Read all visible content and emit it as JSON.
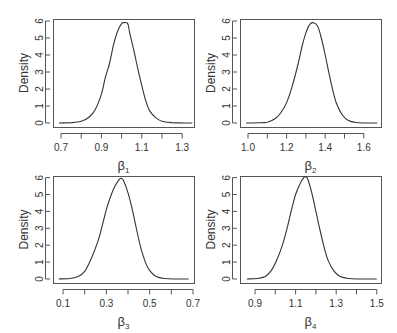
{
  "chart_data": [
    {
      "type": "line",
      "title": "",
      "xlabel": "β1",
      "xlabel_base": "β",
      "xlabel_sub": "1",
      "ylabel": "Density",
      "xticks": [
        0.7,
        0.8,
        0.9,
        1.0,
        1.1,
        1.2,
        1.3
      ],
      "xtick_labels": [
        "0.7",
        "",
        "0.9",
        "",
        "1.1",
        "",
        "1.3"
      ],
      "yticks": [
        0,
        1,
        2,
        3,
        4,
        5,
        6
      ],
      "xlim": [
        0.69,
        1.35
      ],
      "ylim": [
        0,
        6
      ],
      "grid": false,
      "series": [
        {
          "name": "posterior density β1",
          "x": [
            0.69,
            0.75,
            0.8,
            0.84,
            0.87,
            0.9,
            0.92,
            0.94,
            0.96,
            0.98,
            1.0,
            1.01,
            1.03,
            1.04,
            1.06,
            1.08,
            1.1,
            1.12,
            1.14,
            1.17,
            1.2,
            1.25,
            1.3,
            1.35
          ],
          "y": [
            0.0,
            0.02,
            0.1,
            0.35,
            0.8,
            1.7,
            2.7,
            3.5,
            4.6,
            5.4,
            5.85,
            5.9,
            5.85,
            5.3,
            4.3,
            3.2,
            2.2,
            1.3,
            0.7,
            0.3,
            0.1,
            0.02,
            0.0,
            0.0
          ]
        }
      ],
      "layout": {
        "box": [
          53,
          19,
          194,
          127
        ],
        "x0": 0.7,
        "x0px": 61,
        "pxPerUnit": 202,
        "y0px": 123,
        "pxPerY": 17
      }
    },
    {
      "type": "line",
      "title": "",
      "xlabel": "β2",
      "xlabel_base": "β",
      "xlabel_sub": "2",
      "ylabel": "Density",
      "xticks": [
        1.0,
        1.1,
        1.2,
        1.3,
        1.4,
        1.5,
        1.6
      ],
      "xtick_labels": [
        "1.0",
        "",
        "1.2",
        "",
        "1.4",
        "",
        "1.6"
      ],
      "yticks": [
        0,
        1,
        2,
        3,
        4,
        5,
        6
      ],
      "xlim": [
        0.99,
        1.67
      ],
      "ylim": [
        0,
        6
      ],
      "grid": false,
      "series": [
        {
          "name": "posterior density β2",
          "x": [
            0.99,
            1.05,
            1.1,
            1.14,
            1.17,
            1.2,
            1.23,
            1.26,
            1.28,
            1.3,
            1.32,
            1.34,
            1.36,
            1.38,
            1.4,
            1.42,
            1.44,
            1.46,
            1.49,
            1.52,
            1.56,
            1.6,
            1.67
          ],
          "y": [
            0.0,
            0.01,
            0.05,
            0.25,
            0.6,
            1.2,
            2.2,
            3.5,
            4.5,
            5.3,
            5.8,
            5.9,
            5.7,
            5.0,
            4.0,
            2.9,
            1.9,
            1.1,
            0.45,
            0.15,
            0.03,
            0.0,
            0.0
          ]
        }
      ],
      "layout": {
        "box": [
          240,
          19,
          381,
          127
        ],
        "x0": 1.0,
        "x0px": 248,
        "pxPerUnit": 193,
        "y0px": 123,
        "pxPerY": 17
      }
    },
    {
      "type": "line",
      "title": "",
      "xlabel": "β3",
      "xlabel_base": "β",
      "xlabel_sub": "3",
      "ylabel": "Density",
      "xticks": [
        0.1,
        0.2,
        0.3,
        0.4,
        0.5,
        0.6,
        0.7
      ],
      "xtick_labels": [
        "0.1",
        "",
        "0.3",
        "",
        "0.5",
        "",
        "0.7"
      ],
      "yticks": [
        0,
        1,
        2,
        3,
        4,
        5,
        6
      ],
      "xlim": [
        0.08,
        0.68
      ],
      "ylim": [
        0,
        6
      ],
      "grid": false,
      "series": [
        {
          "name": "posterior density β3",
          "x": [
            0.08,
            0.13,
            0.17,
            0.2,
            0.23,
            0.26,
            0.28,
            0.3,
            0.32,
            0.34,
            0.36,
            0.37,
            0.38,
            0.4,
            0.42,
            0.44,
            0.46,
            0.48,
            0.5,
            0.53,
            0.57,
            0.62,
            0.68
          ],
          "y": [
            0.0,
            0.03,
            0.15,
            0.45,
            1.2,
            2.2,
            3.1,
            4.1,
            4.9,
            5.5,
            5.9,
            5.95,
            5.8,
            5.1,
            4.1,
            2.9,
            1.8,
            1.0,
            0.5,
            0.15,
            0.03,
            0.0,
            0.0
          ]
        }
      ],
      "layout": {
        "box": [
          53,
          176,
          194,
          283
        ],
        "x0": 0.1,
        "x0px": 63,
        "pxPerUnit": 216.7,
        "y0px": 279,
        "pxPerY": 16.9
      }
    },
    {
      "type": "line",
      "title": "",
      "xlabel": "β4",
      "xlabel_base": "β",
      "xlabel_sub": "4",
      "ylabel": "Density",
      "xticks": [
        0.9,
        1.0,
        1.1,
        1.2,
        1.3,
        1.4,
        1.5
      ],
      "xtick_labels": [
        "0.9",
        "",
        "1.1",
        "",
        "1.3",
        "",
        "1.5"
      ],
      "yticks": [
        0,
        1,
        2,
        3,
        4,
        5,
        6
      ],
      "xlim": [
        0.86,
        1.5
      ],
      "ylim": [
        0,
        6
      ],
      "grid": false,
      "series": [
        {
          "name": "posterior density β4",
          "x": [
            0.86,
            0.91,
            0.95,
            0.98,
            1.01,
            1.04,
            1.06,
            1.08,
            1.1,
            1.12,
            1.14,
            1.15,
            1.16,
            1.18,
            1.2,
            1.22,
            1.24,
            1.26,
            1.29,
            1.32,
            1.36,
            1.41,
            1.5
          ],
          "y": [
            0.0,
            0.03,
            0.15,
            0.5,
            1.2,
            2.2,
            3.1,
            4.1,
            5.0,
            5.6,
            6.0,
            6.05,
            5.9,
            5.1,
            4.0,
            2.9,
            1.9,
            1.1,
            0.45,
            0.15,
            0.03,
            0.0,
            0.0
          ]
        }
      ],
      "layout": {
        "box": [
          240,
          176,
          381,
          283
        ],
        "x0": 0.9,
        "x0px": 255,
        "pxPerUnit": 203,
        "y0px": 279,
        "pxPerY": 16.9
      }
    }
  ],
  "colors": {
    "axis": "#555555",
    "line": "#333333",
    "text": "#333333",
    "background": "#ffffff"
  }
}
